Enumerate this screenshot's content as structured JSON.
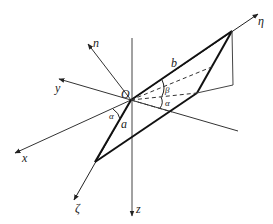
{
  "figure": {
    "type": "3d-coordinate-diagram",
    "origin_label": "O",
    "axes": [
      {
        "name": "x",
        "label": "x"
      },
      {
        "name": "y",
        "label": "y"
      },
      {
        "name": "z",
        "label": "z"
      },
      {
        "name": "n",
        "label": "n"
      },
      {
        "name": "eta",
        "label": "η"
      },
      {
        "name": "zeta",
        "label": "ζ"
      }
    ],
    "edges": {
      "a": "a",
      "b": "b"
    },
    "angles": {
      "alpha_left": "α",
      "alpha_right": "α",
      "beta": "β"
    },
    "colors": {
      "line": "#222222",
      "axis": "#333333"
    }
  }
}
